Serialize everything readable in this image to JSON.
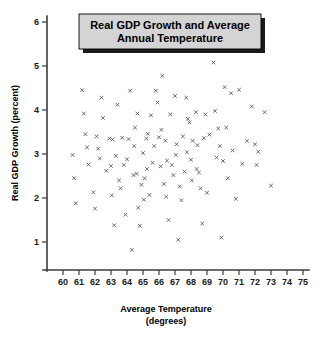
{
  "chart_data": {
    "type": "scatter",
    "title_line1": "Real GDP Growth and Average",
    "title_line2": "Annual Temperature",
    "xlabel": "Average Temperature",
    "xlabel_line2": "(degrees)",
    "ylabel": "Real GDP Growth (percent)",
    "xlim": [
      59.2,
      75.6
    ],
    "ylim": [
      0.3,
      7.35
    ],
    "xticks": [
      60,
      61,
      62,
      63,
      64,
      65,
      66,
      67,
      68,
      69,
      70,
      71,
      72,
      73,
      74,
      75
    ],
    "yticks": [
      1,
      2,
      3,
      4,
      5,
      6,
      7
    ],
    "xtick_labels": [
      "60",
      "61",
      "62",
      "63",
      "64",
      "65",
      "66",
      "67",
      "68",
      "69",
      "70",
      "71",
      "72",
      "73",
      "74",
      "75"
    ],
    "ytick_labels": [
      "1",
      "2",
      "3",
      "4",
      "5",
      "6",
      "7"
    ],
    "grid": false,
    "legend": null,
    "marker": "x",
    "marker_color": "#5a5a66",
    "title_box_fill": "#d4d4d4",
    "title_box_border": "#000000",
    "axis_color": "#3b3b3b",
    "background": "#ffffff",
    "n_points": 112,
    "points": [
      [
        60.6,
        2.98
      ],
      [
        60.7,
        2.45
      ],
      [
        60.8,
        1.88
      ],
      [
        61.2,
        4.45
      ],
      [
        61.3,
        3.92
      ],
      [
        61.4,
        3.45
      ],
      [
        61.5,
        3.15
      ],
      [
        61.6,
        2.76
      ],
      [
        61.9,
        2.13
      ],
      [
        62.0,
        1.76
      ],
      [
        62.1,
        3.4
      ],
      [
        62.2,
        3.12
      ],
      [
        62.4,
        4.28
      ],
      [
        62.5,
        3.82
      ],
      [
        62.9,
        3.35
      ],
      [
        63.0,
        2.73
      ],
      [
        63.1,
        3.33
      ],
      [
        63.2,
        1.38
      ],
      [
        63.4,
        4.12
      ],
      [
        63.5,
        2.4
      ],
      [
        63.6,
        2.22
      ],
      [
        63.7,
        3.37
      ],
      [
        63.8,
        2.75
      ],
      [
        63.9,
        1.62
      ],
      [
        64.0,
        2.88
      ],
      [
        64.1,
        3.34
      ],
      [
        64.2,
        4.44
      ],
      [
        64.3,
        0.82
      ],
      [
        64.4,
        2.52
      ],
      [
        64.5,
        3.6
      ],
      [
        64.6,
        2.55
      ],
      [
        64.7,
        1.78
      ],
      [
        64.8,
        1.37
      ],
      [
        65.0,
        3.02
      ],
      [
        65.1,
        2.45
      ],
      [
        65.2,
        3.35
      ],
      [
        65.3,
        3.46
      ],
      [
        65.4,
        2.07
      ],
      [
        65.5,
        3.88
      ],
      [
        65.6,
        2.8
      ],
      [
        65.8,
        4.44
      ],
      [
        65.9,
        4.17
      ],
      [
        66.0,
        3.38
      ],
      [
        66.1,
        2.72
      ],
      [
        66.2,
        4.78
      ],
      [
        66.3,
        2.32
      ],
      [
        66.4,
        3.3
      ],
      [
        66.5,
        2.85
      ],
      [
        66.6,
        1.5
      ],
      [
        66.7,
        3.9
      ],
      [
        66.8,
        2.75
      ],
      [
        67.0,
        4.32
      ],
      [
        67.1,
        3.22
      ],
      [
        67.2,
        1.05
      ],
      [
        67.3,
        2.26
      ],
      [
        67.4,
        1.95
      ],
      [
        67.5,
        3.4
      ],
      [
        67.6,
        2.6
      ],
      [
        67.7,
        4.28
      ],
      [
        67.8,
        3.8
      ],
      [
        67.9,
        3.72
      ],
      [
        68.0,
        2.87
      ],
      [
        68.1,
        3.3
      ],
      [
        68.2,
        5.4
      ],
      [
        68.3,
        3.95
      ],
      [
        68.4,
        3.2
      ],
      [
        68.5,
        2.58
      ],
      [
        68.6,
        2.22
      ],
      [
        68.7,
        1.42
      ],
      [
        68.8,
        3.36
      ],
      [
        68.9,
        3.9
      ],
      [
        69.0,
        2.12
      ],
      [
        69.2,
        5.42
      ],
      [
        69.4,
        5.08
      ],
      [
        69.5,
        3.98
      ],
      [
        69.6,
        2.92
      ],
      [
        69.7,
        3.58
      ],
      [
        69.8,
        3.18
      ],
      [
        69.9,
        1.1
      ],
      [
        70.0,
        2.84
      ],
      [
        70.1,
        4.52
      ],
      [
        70.2,
        3.6
      ],
      [
        70.3,
        2.45
      ],
      [
        70.5,
        4.38
      ],
      [
        70.8,
        1.98
      ],
      [
        71.0,
        4.46
      ],
      [
        71.2,
        2.78
      ],
      [
        71.8,
        4.08
      ],
      [
        72.0,
        3.22
      ],
      [
        72.1,
        2.75
      ],
      [
        72.2,
        3.05
      ],
      [
        72.6,
        3.95
      ],
      [
        73.0,
        2.28
      ],
      [
        62.7,
        2.62
      ],
      [
        63.3,
        2.96
      ],
      [
        64.9,
        2.3
      ],
      [
        65.7,
        3.18
      ],
      [
        66.9,
        2.52
      ],
      [
        67.05,
        2.98
      ],
      [
        68.35,
        2.66
      ],
      [
        69.15,
        3.44
      ],
      [
        62.3,
        2.9
      ],
      [
        64.45,
        3.18
      ],
      [
        65.25,
        2.66
      ],
      [
        66.15,
        3.55
      ],
      [
        67.75,
        3.04
      ],
      [
        66.45,
        2.03
      ],
      [
        65.05,
        1.96
      ],
      [
        63.05,
        2.06
      ],
      [
        68.05,
        2.4
      ],
      [
        70.6,
        3.08
      ],
      [
        71.5,
        3.3
      ],
      [
        64.65,
        3.92
      ]
    ]
  }
}
